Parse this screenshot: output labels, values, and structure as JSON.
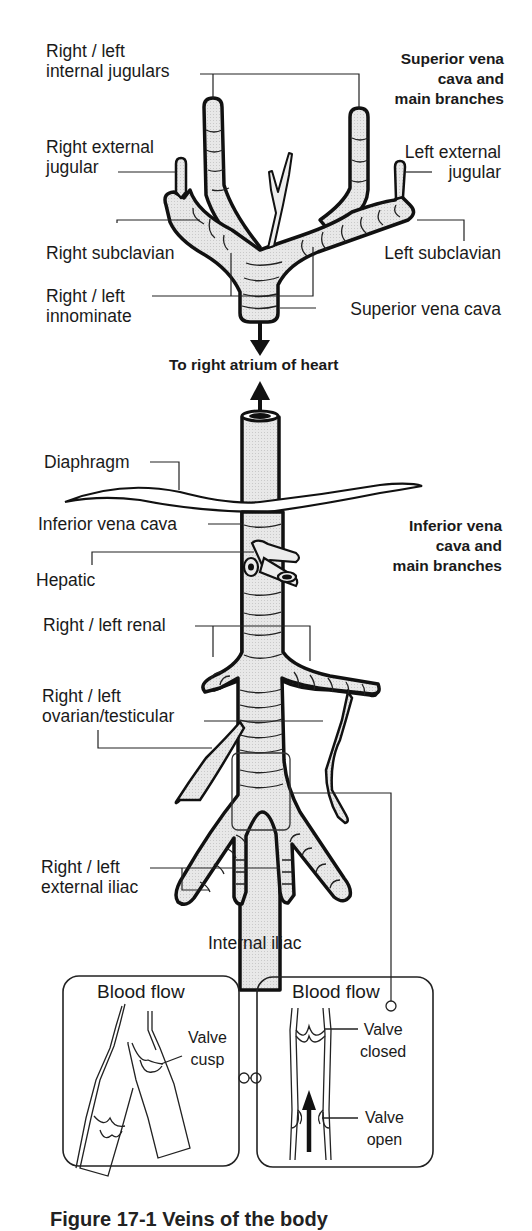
{
  "figure": {
    "superior_section": {
      "heading": [
        "Superior vena",
        "cava and",
        "main branches"
      ],
      "labels": {
        "internal_jugulars": [
          "Right / left",
          "internal jugulars"
        ],
        "right_external_jugular": [
          "Right external",
          "jugular"
        ],
        "left_external_jugular": [
          "Left external",
          "jugular"
        ],
        "right_subclavian": "Right subclavian",
        "left_subclavian": "Left subclavian",
        "innominate": [
          "Right / left",
          "innominate"
        ],
        "superior_vena_cava": "Superior vena cava"
      }
    },
    "heart_label": "To right atrium of heart",
    "inferior_section": {
      "heading": [
        "Inferior vena",
        "cava and",
        "main branches"
      ],
      "labels": {
        "diaphragm": "Diaphragm",
        "inferior_vena_cava": "Inferior vena cava",
        "hepatic": "Hepatic",
        "renal": "Right / left renal",
        "ovarian_testicular": [
          "Right / left",
          "ovarian/testicular"
        ],
        "external_iliac": [
          "Right / left",
          "external iliac"
        ],
        "internal_iliac": "Internal iliac"
      }
    },
    "inset_left": {
      "title": "Blood flow",
      "label": [
        "Valve",
        "cusp"
      ]
    },
    "inset_right": {
      "title": "Blood flow",
      "label_top": [
        "Valve",
        "closed"
      ],
      "label_bottom": [
        "Valve",
        "open"
      ]
    },
    "caption_partial": "Figure  17-1  Veins of the body",
    "colors": {
      "line": "#111111",
      "vessel_fill": "#e6e6e6",
      "background": "#ffffff"
    }
  }
}
